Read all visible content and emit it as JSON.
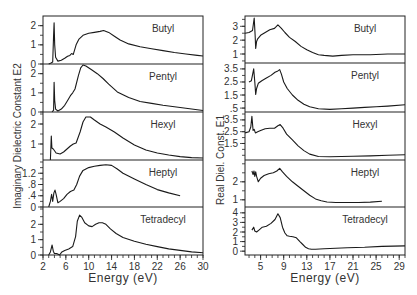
{
  "chart_data": [
    {
      "type": "line",
      "title": "",
      "ylabel": "Imaginary Dielectric Constant E2",
      "xlabel": "Energy (eV)",
      "xlim": [
        2,
        30
      ],
      "xticks": [
        2,
        6,
        10,
        14,
        18,
        22,
        26,
        30
      ],
      "frame": {
        "left": 43,
        "right": 203
      },
      "panels": [
        {
          "name": "Butyl",
          "top": 16,
          "bottom": 64,
          "ylim": [
            0,
            2.4
          ],
          "yticks": [
            {
              "v": 0,
              "l": "0"
            },
            {
              "v": 1,
              "l": "1"
            },
            {
              "v": 2,
              "l": "2"
            }
          ],
          "x": [
            3.0,
            3.4,
            3.7,
            3.85,
            3.95,
            4.05,
            4.2,
            4.6,
            5.2,
            5.8,
            6.3,
            6.7,
            7.0,
            7.3,
            7.8,
            8.3,
            9.0,
            10.0,
            11.0,
            12.0,
            12.6,
            13.5,
            14.5,
            15.5,
            17.0,
            19.0,
            21.0,
            23.0,
            25.0,
            27.0,
            29.0,
            30.0
          ],
          "y": [
            0.0,
            0.05,
            0.1,
            1.5,
            2.15,
            1.0,
            0.35,
            0.15,
            0.2,
            0.3,
            0.4,
            0.45,
            0.55,
            0.5,
            1.0,
            1.3,
            1.5,
            1.6,
            1.65,
            1.7,
            1.75,
            1.65,
            1.45,
            1.25,
            1.05,
            0.9,
            0.8,
            0.7,
            0.6,
            0.52,
            0.45,
            0.42
          ]
        },
        {
          "name": "Pentyl",
          "top": 64,
          "bottom": 112,
          "ylim": [
            0,
            2.4
          ],
          "yticks": [
            {
              "v": 0,
              "l": "0"
            },
            {
              "v": 1,
              "l": "1"
            },
            {
              "v": 2,
              "l": "2"
            }
          ],
          "x": [
            3.6,
            3.85,
            3.95,
            4.05,
            4.2,
            4.6,
            5.2,
            5.8,
            6.3,
            6.8,
            7.2,
            7.6,
            8.2,
            8.6,
            9.0,
            9.5,
            10.5,
            11.5,
            12.5,
            13.5,
            15.0,
            17.0,
            19.0,
            21.0,
            23.0,
            25.0,
            27.0,
            29.0,
            30.0
          ],
          "y": [
            0.0,
            0.1,
            1.55,
            0.6,
            0.15,
            0.05,
            0.15,
            0.35,
            0.6,
            0.85,
            1.0,
            1.2,
            1.9,
            2.3,
            2.45,
            2.4,
            2.2,
            2.0,
            1.75,
            1.45,
            1.05,
            0.75,
            0.55,
            0.45,
            0.35,
            0.27,
            0.2,
            0.12,
            0.08
          ]
        },
        {
          "name": "Hexyl",
          "top": 112,
          "bottom": 160,
          "ylim": [
            0.2,
            2.5
          ],
          "yticks": [
            {
              "v": 1,
              "l": "1"
            },
            {
              "v": 2,
              "l": "2"
            }
          ],
          "x": [
            3.3,
            3.4,
            3.45,
            3.55,
            3.8,
            4.3,
            5.0,
            5.6,
            6.2,
            6.8,
            7.3,
            7.8,
            8.5,
            9.0,
            9.5,
            10.3,
            11.0,
            12.0,
            13.0,
            14.5,
            16.0,
            18.0,
            20.0,
            22.0,
            24.0,
            26.0,
            28.0,
            30.0
          ],
          "y": [
            0.2,
            1.0,
            1.4,
            0.8,
            0.75,
            0.55,
            0.5,
            0.6,
            0.75,
            0.9,
            1.0,
            1.05,
            1.6,
            2.1,
            2.35,
            2.35,
            2.2,
            2.0,
            1.85,
            1.6,
            1.3,
            0.95,
            0.7,
            0.55,
            0.45,
            0.37,
            0.32,
            0.3
          ]
        },
        {
          "name": "Heptyl",
          "top": 160,
          "bottom": 207,
          "ylim": [
            0,
            1.6
          ],
          "yticks": [
            {
              "v": 0,
              "l": "0"
            },
            {
              "v": 0.4,
              "l": ".4"
            },
            {
              "v": 0.8,
              "l": ".8"
            },
            {
              "v": 1.2,
              "l": "1.2"
            }
          ],
          "x": [
            3.0,
            3.3,
            3.5,
            3.7,
            3.9,
            4.1,
            4.3,
            4.6,
            5.0,
            5.6,
            6.2,
            6.8,
            7.4,
            7.9,
            8.4,
            9.0,
            10.0,
            11.0,
            12.0,
            13.0,
            14.0,
            15.0,
            16.0,
            18.0,
            20.0,
            22.0,
            24.0,
            26.0
          ],
          "y": [
            0.0,
            0.2,
            0.45,
            0.2,
            0.5,
            0.6,
            0.45,
            0.15,
            0.2,
            0.3,
            0.45,
            0.55,
            0.6,
            0.8,
            1.1,
            1.3,
            1.4,
            1.45,
            1.48,
            1.5,
            1.48,
            1.35,
            1.2,
            1.0,
            0.8,
            0.62,
            0.5,
            0.4
          ]
        },
        {
          "name": "Tetradecyl",
          "top": 207,
          "bottom": 255,
          "ylim": [
            0,
            3.0
          ],
          "yticks": [
            {
              "v": 0,
              "l": "0"
            },
            {
              "v": 1,
              "l": "1"
            },
            {
              "v": 2,
              "l": "2"
            }
          ],
          "x": [
            3.0,
            3.3,
            3.6,
            3.8,
            4.0,
            4.4,
            4.9,
            5.3,
            5.8,
            6.5,
            7.2,
            7.7,
            8.0,
            8.4,
            8.8,
            9.3,
            10.0,
            10.6,
            11.2,
            11.8,
            12.4,
            13.0,
            13.8,
            14.8,
            16.0,
            18.0,
            20.0,
            22.0,
            24.0,
            26.0,
            28.0,
            30.0
          ],
          "y": [
            0.0,
            0.2,
            0.65,
            0.25,
            0.1,
            0.1,
            0.0,
            0.2,
            0.3,
            0.4,
            0.55,
            1.2,
            2.2,
            2.6,
            2.45,
            2.1,
            1.9,
            1.85,
            2.0,
            2.1,
            2.1,
            2.0,
            1.7,
            1.4,
            1.15,
            0.9,
            0.7,
            0.55,
            0.4,
            0.3,
            0.2,
            0.15
          ]
        }
      ]
    },
    {
      "type": "line",
      "title": "",
      "ylabel": "Real Diel. Const. E1",
      "xlabel": "Energy (eV)",
      "xlim": [
        2.3,
        30
      ],
      "xticks": [
        5,
        9,
        13,
        17,
        21,
        25,
        29
      ],
      "frame": {
        "left": 245,
        "right": 405
      },
      "panels": [
        {
          "name": "Butyl",
          "top": 16,
          "bottom": 63,
          "ylim": [
            0.35,
            3.6
          ],
          "yticks": [
            {
              "v": 1,
              "l": "1"
            },
            {
              "v": 2,
              "l": "2"
            },
            {
              "v": 3,
              "l": "3"
            }
          ],
          "x": [
            2.3,
            3.0,
            3.6,
            3.9,
            4.05,
            4.15,
            4.3,
            4.5,
            5.0,
            5.8,
            6.6,
            7.4,
            8.0,
            8.6,
            9.2,
            10.0,
            11.0,
            12.0,
            13.0,
            14.0,
            15.0,
            16.0,
            17.5,
            19.0,
            21.0,
            24.0,
            27.0,
            30.0
          ],
          "y": [
            2.5,
            2.55,
            2.7,
            3.6,
            2.4,
            1.4,
            1.9,
            2.1,
            2.35,
            2.55,
            2.75,
            2.85,
            3.1,
            2.85,
            2.55,
            2.2,
            1.9,
            1.55,
            1.3,
            1.1,
            0.95,
            0.9,
            0.85,
            0.9,
            0.95,
            0.95,
            1.0,
            1.0
          ]
        },
        {
          "name": "Pentyl",
          "top": 63,
          "bottom": 112,
          "ylim": [
            0.2,
            3.8
          ],
          "yticks": [
            {
              "v": 0.5,
              "l": ".5"
            },
            {
              "v": 1.5,
              "l": "1.5"
            },
            {
              "v": 2.5,
              "l": "2.5"
            },
            {
              "v": 3.5,
              "l": "3.5"
            }
          ],
          "x": [
            3.0,
            3.4,
            3.8,
            4.0,
            4.15,
            4.3,
            4.6,
            5.2,
            6.0,
            6.8,
            7.5,
            8.0,
            8.3,
            8.6,
            9.0,
            9.6,
            10.5,
            11.5,
            12.5,
            13.5,
            15.0,
            17.0,
            19.0,
            21.0,
            23.0,
            25.0,
            27.0,
            30.0
          ],
          "y": [
            2.5,
            2.6,
            3.5,
            2.5,
            1.55,
            2.0,
            2.4,
            2.6,
            2.8,
            3.0,
            3.25,
            3.35,
            3.45,
            3.1,
            2.5,
            2.0,
            1.5,
            1.1,
            0.8,
            0.6,
            0.45,
            0.4,
            0.45,
            0.5,
            0.55,
            0.6,
            0.65,
            0.75
          ]
        },
        {
          "name": "Hexyl",
          "top": 112,
          "bottom": 160,
          "ylim": [
            0.1,
            4.0
          ],
          "yticks": [
            {
              "v": 1.5,
              "l": "1.5"
            },
            {
              "v": 2.5,
              "l": "2.5"
            },
            {
              "v": 3.5,
              "l": "3.5"
            }
          ],
          "x": [
            2.3,
            3.0,
            3.3,
            3.5,
            3.7,
            3.9,
            4.1,
            4.5,
            5.0,
            5.8,
            6.6,
            7.4,
            8.0,
            8.4,
            8.9,
            9.5,
            10.5,
            11.5,
            12.5,
            13.5,
            15.0,
            17.0,
            19.0,
            21.0,
            24.0,
            27.0,
            30.0
          ],
          "y": [
            2.4,
            2.5,
            2.9,
            3.8,
            2.6,
            2.7,
            2.4,
            2.5,
            2.6,
            2.75,
            2.8,
            2.8,
            3.0,
            3.1,
            2.8,
            2.3,
            1.8,
            1.3,
            0.9,
            0.6,
            0.4,
            0.38,
            0.4,
            0.42,
            0.45,
            0.5,
            0.55
          ]
        },
        {
          "name": "Heptyl",
          "top": 160,
          "bottom": 207,
          "ylim": [
            0.6,
            3.1
          ],
          "yticks": [
            {
              "v": 1,
              "l": "1"
            },
            {
              "v": 2,
              "l": "2"
            }
          ],
          "x": [
            3.5,
            3.7,
            3.85,
            4.0,
            4.15,
            4.3,
            4.6,
            5.0,
            5.6,
            6.4,
            7.2,
            7.8,
            8.3,
            8.8,
            9.5,
            10.5,
            11.5,
            12.5,
            13.5,
            14.5,
            15.5,
            16.5,
            18.0,
            20.0,
            22.0,
            24.0,
            26.0
          ],
          "y": [
            2.6,
            2.4,
            2.6,
            2.3,
            2.55,
            2.3,
            2.0,
            2.2,
            2.35,
            2.45,
            2.5,
            2.6,
            2.75,
            2.55,
            2.3,
            2.0,
            1.75,
            1.5,
            1.25,
            1.05,
            0.95,
            0.88,
            0.85,
            0.85,
            0.85,
            0.87,
            0.92
          ]
        },
        {
          "name": "Tetradecyl",
          "top": 207,
          "bottom": 255,
          "ylim": [
            -0.4,
            4.4
          ],
          "yticks": [
            {
              "v": 0,
              "l": "0"
            },
            {
              "v": 1,
              "l": "1"
            },
            {
              "v": 2,
              "l": "2"
            },
            {
              "v": 3,
              "l": "3"
            },
            {
              "v": 4,
              "l": "4"
            }
          ],
          "x": [
            3.5,
            3.8,
            4.0,
            4.3,
            4.7,
            5.3,
            6.0,
            6.8,
            7.5,
            8.0,
            8.4,
            8.8,
            9.2,
            9.6,
            10.0,
            10.6,
            11.2,
            11.8,
            12.3,
            12.8,
            13.3,
            13.8,
            14.5,
            16.0,
            18.0,
            20.0,
            23.0,
            26.0,
            30.0
          ],
          "y": [
            2.2,
            2.5,
            2.1,
            2.0,
            2.2,
            2.5,
            2.6,
            2.9,
            3.3,
            3.9,
            3.5,
            2.5,
            1.9,
            1.6,
            1.55,
            1.5,
            1.4,
            1.0,
            0.7,
            0.4,
            0.25,
            0.2,
            0.2,
            0.25,
            0.3,
            0.35,
            0.4,
            0.5,
            0.55
          ]
        }
      ]
    }
  ]
}
